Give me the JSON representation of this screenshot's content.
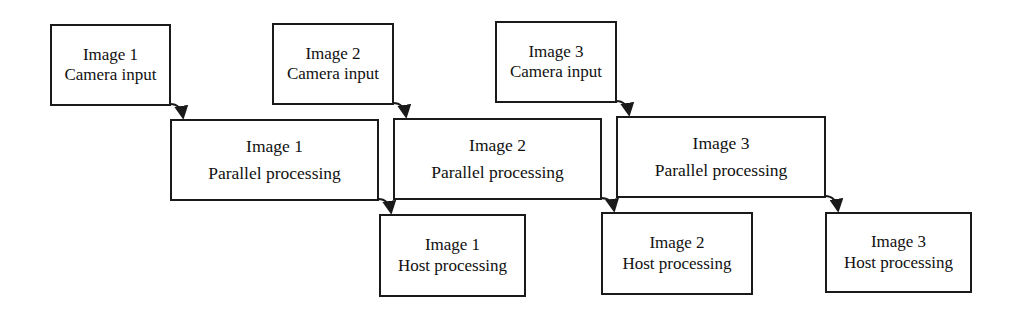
{
  "diagram": {
    "type": "pipeline-timing",
    "rows": [
      "camera_input",
      "parallel_processing",
      "host_processing"
    ],
    "nodes": {
      "cam1": {
        "line1": "Image 1",
        "line2": "Camera input"
      },
      "cam2": {
        "line1": "Image 2",
        "line2": "Camera input"
      },
      "cam3": {
        "line1": "Image 3",
        "line2": "Camera input"
      },
      "par1": {
        "line1": "Image 1",
        "line2": "Parallel processing"
      },
      "par2": {
        "line1": "Image 2",
        "line2": "Parallel processing"
      },
      "par3": {
        "line1": "Image 3",
        "line2": "Parallel processing"
      },
      "host1": {
        "line1": "Image 1",
        "line2": "Host processing"
      },
      "host2": {
        "line1": "Image 2",
        "line2": "Host processing"
      },
      "host3": {
        "line1": "Image 3",
        "line2": "Host processing"
      }
    },
    "edges": [
      {
        "from": "cam1",
        "to": "par1"
      },
      {
        "from": "cam2",
        "to": "par2"
      },
      {
        "from": "cam3",
        "to": "par3"
      },
      {
        "from": "par1",
        "to": "host1"
      },
      {
        "from": "par2",
        "to": "host2"
      },
      {
        "from": "par3",
        "to": "host3"
      }
    ],
    "colors": {
      "stroke": "#1a1a1a",
      "fill": "#ffffff",
      "text": "#111111"
    }
  }
}
